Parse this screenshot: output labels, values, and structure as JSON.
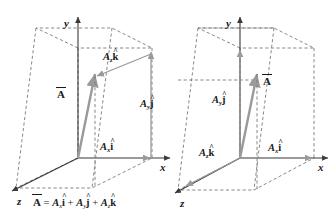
{
  "figure": {
    "caption_equation": {
      "lhs": "A",
      "eq": "=",
      "term1_coef": "A",
      "term1_sub": "x",
      "term1_unit": "i",
      "plus1": "+",
      "term2_coef": "A",
      "term2_sub": "y",
      "term2_unit": "j",
      "plus2": "+",
      "term3_coef": "A",
      "term3_sub": "z",
      "term3_unit": "k"
    },
    "colors": {
      "axis": "#3a3a3a",
      "dashed": "#7a7a7a",
      "vector": "#9a9a9a",
      "text": "#1a1a1a",
      "background": "#ffffff"
    }
  },
  "diagrams": [
    {
      "id": "left-diagram",
      "axes": [
        {
          "name": "y-axis",
          "label": "y"
        },
        {
          "name": "x-axis",
          "label": "x"
        },
        {
          "name": "z-axis",
          "label": "z"
        }
      ],
      "labels": [
        {
          "name": "vector-A-label",
          "text": "A",
          "sub": "",
          "unit": "",
          "overbar": true
        },
        {
          "name": "component-Az-k",
          "text": "A",
          "sub": "z",
          "unit": "k",
          "overbar": false
        },
        {
          "name": "component-Ay-j",
          "text": "A",
          "sub": "y",
          "unit": "j",
          "overbar": false
        },
        {
          "name": "component-Ax-i",
          "text": "A",
          "sub": "x",
          "unit": "i",
          "overbar": false
        }
      ]
    },
    {
      "id": "right-diagram",
      "axes": [
        {
          "name": "y-axis",
          "label": "y"
        },
        {
          "name": "x-axis",
          "label": "x"
        },
        {
          "name": "z-axis",
          "label": "z"
        }
      ],
      "labels": [
        {
          "name": "vector-A-label",
          "text": "A",
          "sub": "",
          "unit": "",
          "overbar": true
        },
        {
          "name": "component-Ay-j",
          "text": "A",
          "sub": "y",
          "unit": "j",
          "overbar": false
        },
        {
          "name": "component-Az-k",
          "text": "A",
          "sub": "z",
          "unit": "k",
          "overbar": false
        },
        {
          "name": "component-Ax-i",
          "text": "A",
          "sub": "x",
          "unit": "i",
          "overbar": false
        }
      ]
    }
  ]
}
